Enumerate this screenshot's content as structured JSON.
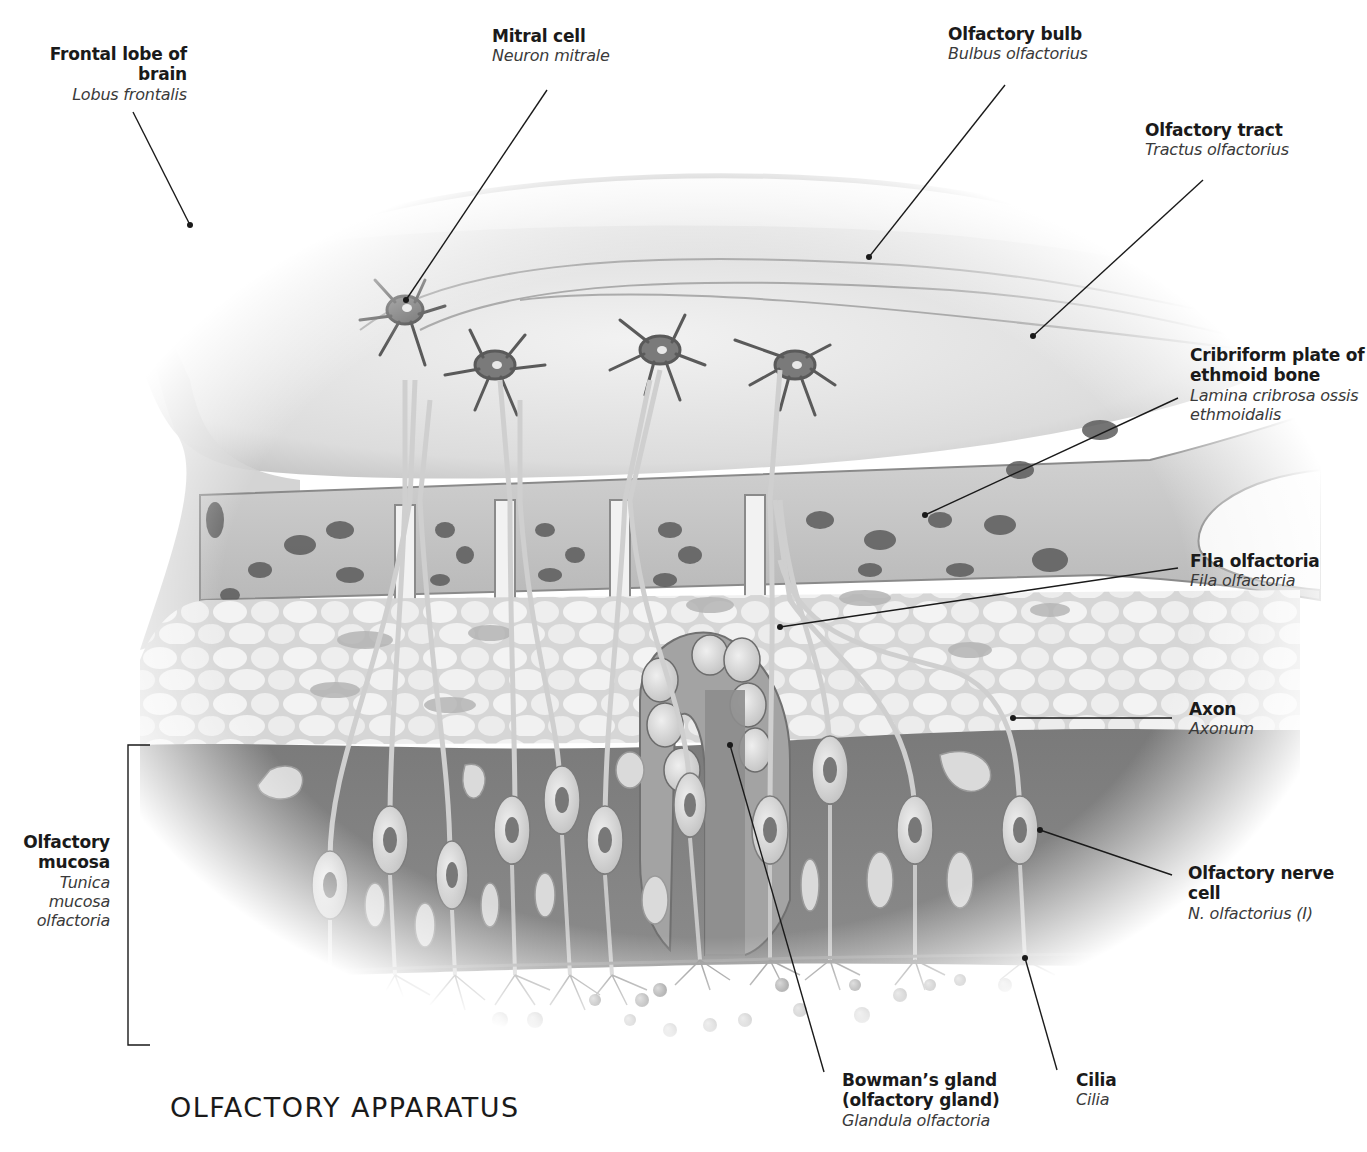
{
  "diagram": {
    "title": "OLFACTORY APPARATUS",
    "style": "grayscale anatomical illustration, sagittal cross-section",
    "labels": [
      {
        "id": "frontal-lobe",
        "term": "Frontal lobe of brain",
        "latin": "Lobus frontalis"
      },
      {
        "id": "mitral-cell",
        "term": "Mitral cell",
        "latin": "Neuron mitrale"
      },
      {
        "id": "olfactory-bulb",
        "term": "Olfactory bulb",
        "latin": "Bulbus olfactorius"
      },
      {
        "id": "olfactory-tract",
        "term": "Olfactory tract",
        "latin": "Tractus olfactorius"
      },
      {
        "id": "cribriform-plate",
        "term": "Cribriform plate of ethmoid bone",
        "term_line1": "Cribriform plate of",
        "term_line2": "ethmoid bone",
        "latin": "Lamina cribrosa ossis ethmoidalis",
        "latin_line1": "Lamina cribrosa ossis",
        "latin_line2": "ethmoidalis"
      },
      {
        "id": "fila-olfactoria",
        "term": "Fila olfactoria",
        "latin": "Fila olfactoria"
      },
      {
        "id": "axon",
        "term": "Axon",
        "latin": "Axonum"
      },
      {
        "id": "olfactory-nerve-cell",
        "term": "Olfactory nerve cell",
        "latin": "N. olfactorius (I)"
      },
      {
        "id": "cilia",
        "term": "Cilia",
        "latin": "Cilia"
      },
      {
        "id": "bowmans-gland",
        "term": "Bowman’s gland (olfactory gland)",
        "term_line1": "Bowman’s gland",
        "term_line2": "(olfactory gland)",
        "latin": "Glandula olfactoria"
      },
      {
        "id": "olfactory-mucosa",
        "term": "Olfactory mucosa",
        "term_line1": "Olfactory",
        "term_line2": "mucosa",
        "latin": "Tunica mucosa olfactoria",
        "latin_line1": "Tunica mucosa",
        "latin_line2": "olfactoria"
      }
    ]
  }
}
